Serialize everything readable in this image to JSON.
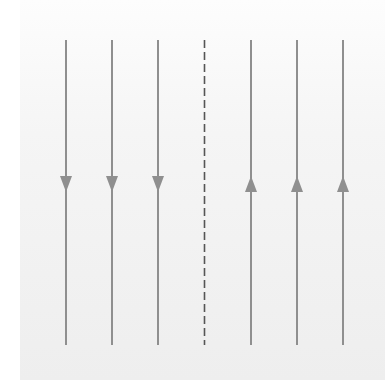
{
  "diagram": {
    "line_color": "#8f8f8f",
    "dash_color": "#555555",
    "line_top": 40,
    "line_bottom": 345,
    "arrow_y": 184,
    "left_lines": [
      {
        "x": 66,
        "direction": "down"
      },
      {
        "x": 112,
        "direction": "down"
      },
      {
        "x": 158,
        "direction": "down"
      }
    ],
    "divider": {
      "x": 204.5,
      "style": "dashed"
    },
    "right_lines": [
      {
        "x": 251,
        "direction": "up"
      },
      {
        "x": 297,
        "direction": "up"
      },
      {
        "x": 343,
        "direction": "up"
      }
    ]
  }
}
